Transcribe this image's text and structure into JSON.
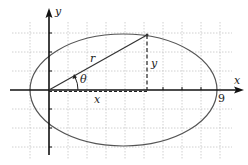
{
  "diagram": {
    "labels": {
      "y_axis": "y",
      "x_axis": "x",
      "radius": "r",
      "vertical_leg": "y",
      "horizontal_leg": "x",
      "angle": "θ",
      "x_intercept": "9"
    },
    "colors": {
      "axis": "#111111",
      "grid": "#bdbdbd",
      "ellipse": "#555555",
      "radius": "#333333"
    },
    "geometry": {
      "origin": [
        49,
        90
      ],
      "ellipse_center": [
        123.5,
        90
      ],
      "ellipse_rx": 93.5,
      "ellipse_ry": 56,
      "point_on_ellipse": [
        147,
        35
      ],
      "grid_spacing": 19
    }
  }
}
